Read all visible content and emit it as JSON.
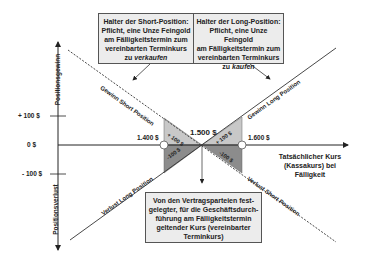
{
  "diagram": {
    "top_left_box": {
      "line1": "Halter der Short-Position:",
      "line2": "Pflicht, eine Unze Feingold",
      "line3": "am Fälligkeitstermin zum",
      "line4": "vereinbarten Terminkurs",
      "line5_prefix": "zu ",
      "line5_emph": "verkaufen"
    },
    "top_right_box": {
      "line1": "Halter der Long-Position:",
      "line2": "Pflicht, eine Unze Feingold",
      "line3": "am Fälligkeitstermin zum",
      "line4": "vereinbarten Terminkurs",
      "line5_prefix": "zu ",
      "line5_emph": "kaufen"
    },
    "bottom_box": {
      "line1": "Von den Vertragsparteien fest-",
      "line2": "gelegter, für die Geschäftsdurch-",
      "line3": "führung am Fälligkeitstermin",
      "line4": "geltender Kurs (vereinbarter",
      "line5": "Terminkurs)"
    },
    "y_axis": {
      "upper_label": "Positionsgewinn",
      "lower_label": "Positionsverlust",
      "ticks": [
        "+ 100 $",
        "0 $",
        "- 100 $"
      ]
    },
    "x_axis": {
      "label_line1": "Tatsächlicher Kurs",
      "label_line2": "(Kassakurs) bei",
      "label_line3": "Fälligkeit",
      "points": [
        "1.400 $",
        "1.500 $",
        "1.600 $"
      ]
    },
    "lines": {
      "gain_short": "Gewinn Short Position",
      "gain_long": "Gewinn Long Position",
      "loss_long": "Verlust Long Position",
      "loss_short": "Verlust Short Position"
    },
    "triangles": {
      "left_upper": "+ 100 $",
      "left_lower": "-100 $",
      "right_upper": "+ 100 $",
      "right_lower": "-100 $"
    },
    "colors": {
      "light_triangle": "#c8c8c8",
      "dark_triangle": "#8c8c8c",
      "box_fill": "#ececec",
      "line": "#333333"
    }
  }
}
